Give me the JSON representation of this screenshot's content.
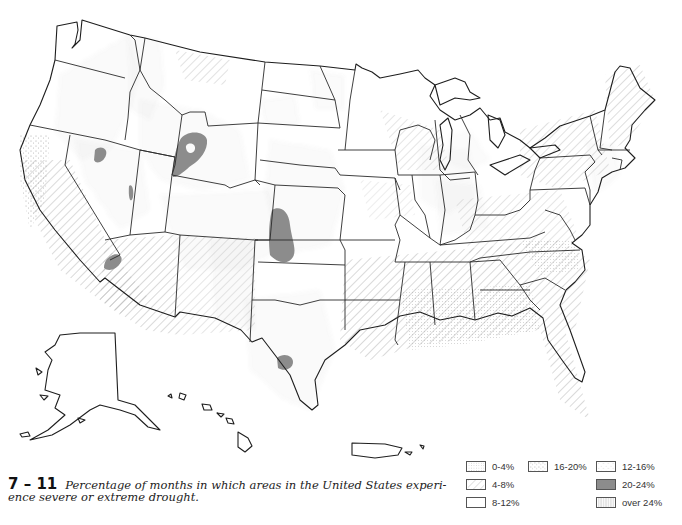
{
  "figure": {
    "number": "7 – 11",
    "caption": "Percentage of months in which areas in the United States experience severe or extreme drought.",
    "caption_line1": "Percentage of months in which areas in the United States experi-",
    "caption_line2": "ence severe or extreme drought."
  },
  "legend": {
    "items": [
      {
        "label": "0-4%",
        "pattern": "fine-dots",
        "col": 0,
        "row": 0
      },
      {
        "label": "4-8%",
        "pattern": "diagonal-hatch",
        "col": 0,
        "row": 1
      },
      {
        "label": "8-12%",
        "pattern": "blank",
        "col": 0,
        "row": 2
      },
      {
        "label": "16-20%",
        "pattern": "dense-stipple",
        "col": 1,
        "row": 0
      },
      {
        "label": "12-16%",
        "pattern": "light-stipple",
        "col": 2,
        "row": 0
      },
      {
        "label": "20-24%",
        "pattern": "solid-gray",
        "col": 2,
        "row": 1
      },
      {
        "label": "over 24%",
        "pattern": "vertical-lines",
        "col": 2,
        "row": 2
      }
    ]
  },
  "map": {
    "subject": "United States drought frequency",
    "regions_shown": [
      "Contiguous United States",
      "Alaska",
      "Hawaii",
      "Puerto Rico"
    ],
    "colors": {
      "outline": "#2a2a2a",
      "hatch": "#b8b8b8",
      "stipple": "#8a8a8a",
      "solid": "#8c8c8c",
      "background": "#ffffff"
    }
  }
}
